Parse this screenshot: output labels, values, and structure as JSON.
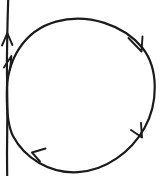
{
  "figure": {
    "background_color": "#ffffff",
    "stroke_color": "#1b1b1b",
    "width": 160,
    "height": 176,
    "elements": {
      "vertical_line": {
        "name": "vertical-axis-line",
        "x": 7,
        "y_top": 0,
        "y_bottom": 176,
        "stroke_width": 2.2,
        "direction": "up",
        "arrow_tip_y": 33
      },
      "circle": {
        "name": "circulation-circle",
        "center_x": 80,
        "center_y": 96,
        "radius_x": 74,
        "radius_y": 76,
        "stroke_width": 2.2,
        "direction": "clockwise"
      },
      "circle_arrowheads": [
        {
          "name": "arrowhead-upper-left",
          "x": 11,
          "y": 58,
          "angle_deg": -62,
          "position_label": "upper-left"
        },
        {
          "name": "arrowhead-upper-right",
          "x": 142,
          "y": 50,
          "angle_deg": 62,
          "position_label": "upper-right"
        },
        {
          "name": "arrowhead-lower-right",
          "x": 143,
          "y": 136,
          "angle_deg": 118,
          "position_label": "lower-right"
        },
        {
          "name": "arrowhead-lower-left",
          "x": 33,
          "y": 153,
          "angle_deg": 242,
          "position_label": "lower-left"
        }
      ]
    }
  }
}
